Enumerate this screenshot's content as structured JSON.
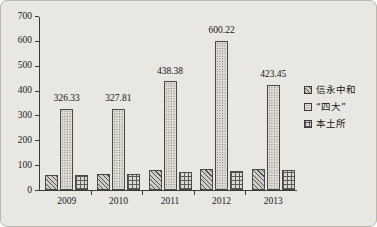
{
  "chart_data": {
    "type": "bar",
    "title": "",
    "subtitle": "",
    "xlabel": "",
    "ylabel": "",
    "categories": [
      "2009",
      "2010",
      "2011",
      "2012",
      "2013"
    ],
    "ylim": [
      0,
      700
    ],
    "yticks": [
      0,
      100,
      200,
      300,
      400,
      500,
      600,
      700
    ],
    "ytick_labels": [
      "0",
      "100",
      "200",
      "300",
      "400",
      "500",
      "600",
      "700"
    ],
    "grid": false,
    "legend_position": "right",
    "series": [
      {
        "name": "信永中和",
        "pattern": "diagonal-hatch",
        "values": [
          60,
          66,
          79,
          84,
          85
        ],
        "data_labels": [
          "",
          "",
          "",
          "",
          ""
        ]
      },
      {
        "name": "“四大”",
        "pattern": "dots",
        "values": [
          326.33,
          327.81,
          438.38,
          600.22,
          423.45
        ],
        "data_labels": [
          "326.33",
          "327.81",
          "438.38",
          "600.22",
          "423.45"
        ]
      },
      {
        "name": "本土所",
        "pattern": "crosshatch-grid",
        "values": [
          62,
          65,
          72,
          76,
          81
        ],
        "data_labels": [
          "",
          "",
          "",
          "",
          ""
        ]
      }
    ]
  },
  "colors": {
    "background": "#e8e7e2",
    "border": "#b9b7b0",
    "axis": "#3a3a3a",
    "text": "#141414",
    "bar_outline": "#4a4a4a"
  }
}
